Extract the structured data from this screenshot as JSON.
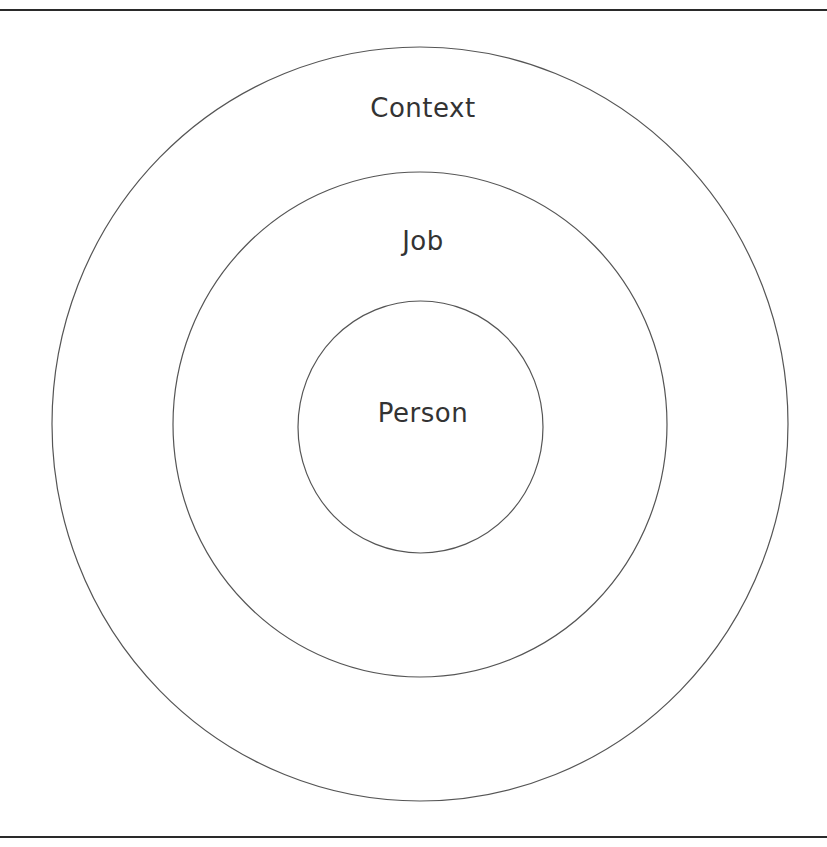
{
  "diagram": {
    "type": "nested-circles",
    "rings": [
      {
        "label": "Context",
        "level": "outer"
      },
      {
        "label": "Job",
        "level": "middle"
      },
      {
        "label": "Person",
        "level": "inner"
      }
    ],
    "colors": {
      "line": "#555555",
      "text": "#333333",
      "rule": "#2a2a2a",
      "background": "#ffffff"
    }
  }
}
